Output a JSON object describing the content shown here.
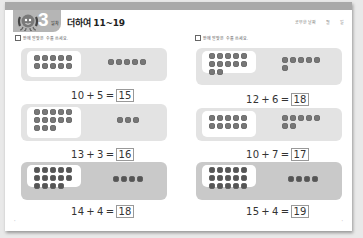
{
  "header": {
    "unit_number": "3",
    "unit_suffix": "일차",
    "title": "더하여 11~19",
    "date_label": "공부한 날짜",
    "month_label": "월",
    "day_label": "일",
    "mascot_icon": "octopus-mascot-icon"
  },
  "left_column": {
    "instruction": "안에 알맞은 수를 쓰세요.",
    "problems": [
      {
        "a": "10",
        "op": "+",
        "b": "5",
        "eq": "=",
        "answer": "15",
        "frame_dots": 10,
        "extra_dots": 5
      },
      {
        "a": "13",
        "op": "+",
        "b": "3",
        "eq": "=",
        "answer": "16",
        "frame_dots": 13,
        "extra_dots": 3
      },
      {
        "a": "14",
        "op": "+",
        "b": "4",
        "eq": "=",
        "answer": "18",
        "frame_dots": 14,
        "extra_dots": 4
      }
    ]
  },
  "right_column": {
    "instruction": "안에 알맞은 수를 쓰세요.",
    "problems": [
      {
        "a": "12",
        "op": "+",
        "b": "6",
        "eq": "=",
        "answer": "18",
        "frame_dots": 12,
        "extra_dots": 6
      },
      {
        "a": "10",
        "op": "+",
        "b": "7",
        "eq": "=",
        "answer": "17",
        "frame_dots": 10,
        "extra_dots": 7
      },
      {
        "a": "15",
        "op": "+",
        "b": "4",
        "eq": "=",
        "answer": "19",
        "frame_dots": 15,
        "extra_dots": 4
      }
    ]
  },
  "footer": {
    "left_page_marker": "-",
    "right_page_marker": "-"
  },
  "colors": {
    "top_bar": "#a9a9a9",
    "panel_light": "#e3e3e3",
    "panel_dark": "#c9c9c9",
    "dot": "#777777"
  }
}
